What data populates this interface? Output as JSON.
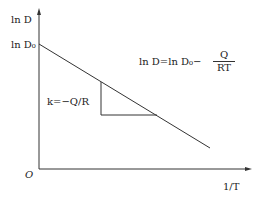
{
  "diagram": {
    "y_axis_label": "ln D",
    "y_intercept_label": "ln D₀",
    "origin_label": "O",
    "x_axis_label": "1/T",
    "slope_label": "k=−Q/R",
    "equation": {
      "lhs": "ln D=ln D₀−",
      "numerator": "Q",
      "denominator": "RT"
    },
    "line_color": "#222222"
  }
}
